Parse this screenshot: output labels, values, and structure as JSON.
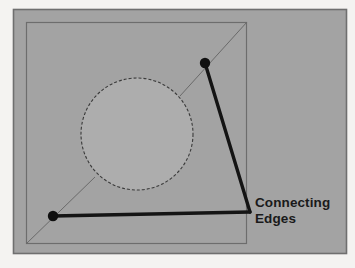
{
  "figure": {
    "name": "connecting-edges-diagram",
    "background_color": "#f4f3f1",
    "panel_color": "#a3a3a3",
    "panel_border_color": "#6f6f6f",
    "inner_square_color": "#6a6a6a",
    "circle_fill_color": "#adadad",
    "circle_stroke_color": "#3a3a3a",
    "thin_line_color": "#6a6a6a",
    "edge_color": "#141414",
    "vertex_color": "#101010",
    "text_color": "#1a1a1a"
  },
  "annotation": {
    "line1": "Connecting",
    "line2": "Edges"
  },
  "geometry": {
    "panel": {
      "x": 13,
      "y": 9,
      "width": 334,
      "height": 245
    },
    "inner_square": {
      "x": 26,
      "y": 22,
      "width": 221,
      "height": 222
    },
    "circle": {
      "cx": 137,
      "cy": 134,
      "r": 56
    },
    "vertices": [
      {
        "name": "vertex-top-right",
        "cx": 205,
        "cy": 63,
        "r": 5.2
      },
      {
        "name": "vertex-bottom-left",
        "cx": 53,
        "cy": 216,
        "r": 5.2
      }
    ],
    "connecting_edges": [
      {
        "name": "edge-right",
        "x1": 205,
        "y1": 63,
        "x2": 250,
        "y2": 212
      },
      {
        "name": "edge-bottom",
        "x1": 53,
        "y1": 216,
        "x2": 250,
        "y2": 212
      }
    ],
    "thin_diagonals": [
      {
        "name": "diagonal-top-right",
        "x1": 247,
        "y1": 22,
        "x2": 178,
        "y2": 98
      },
      {
        "name": "diagonal-bottom-left",
        "x1": 26,
        "y1": 244,
        "x2": 97,
        "y2": 175
      }
    ],
    "annotation_position": {
      "x": 255,
      "y": 207,
      "line_height": 16
    }
  }
}
